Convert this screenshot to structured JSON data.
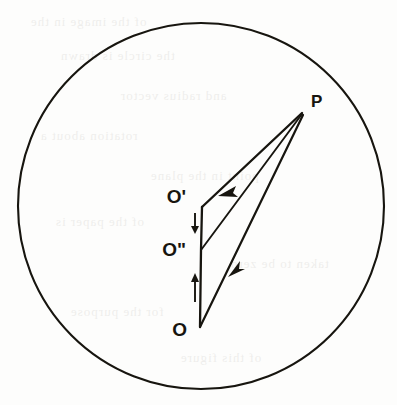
{
  "figure": {
    "type": "geometric-vector-diagram",
    "background_color": "#fdfdfc",
    "ink_color": "#17150f",
    "circle": {
      "label": "field-circle",
      "center_x": 201,
      "center_y": 206,
      "radius": 183,
      "stroke_width": 2.1
    },
    "points": [
      {
        "id": "P",
        "label": "P",
        "x": 302,
        "y": 113,
        "label_x": 311,
        "label_y": 107
      },
      {
        "id": "Op",
        "label": "O'",
        "x": 202,
        "y": 207,
        "label_x": 186,
        "label_y": 203
      },
      {
        "id": "Od",
        "label": "O\"",
        "x": 201,
        "y": 250,
        "label_x": 186,
        "label_y": 251
      },
      {
        "id": "O",
        "label": "O",
        "x": 200,
        "y": 327,
        "label_x": 187,
        "label_y": 335
      }
    ],
    "segments": [
      {
        "name": "P-to-Oprime",
        "from": "P",
        "to": "Op",
        "arrow": true,
        "arrow_at_x": 224,
        "arrow_at_y": 192
      },
      {
        "name": "P-to-Odouble",
        "from": "P",
        "to": "Od",
        "arrow": false
      },
      {
        "name": "P-to-O",
        "from": "P",
        "to": "O",
        "arrow": true,
        "arrow_at_x": 233,
        "arrow_at_y": 271
      },
      {
        "name": "O-to-Oprime-axis",
        "from": "O",
        "to": "Op",
        "arrow": false
      }
    ],
    "tick_arrows": [
      {
        "name": "down-arrow-to-Odouble",
        "direction": "down",
        "x": 195,
        "y_start": 214,
        "y_end": 232
      },
      {
        "name": "up-arrow-to-Odouble",
        "direction": "up",
        "x": 195,
        "y_start": 301,
        "y_end": 275
      }
    ],
    "ghost_text_lines": [
      "of the image in the",
      "the circle is drawn",
      "and radius vector",
      "rotation about a",
      "point in the plane",
      "of the paper is",
      "taken to be zero",
      "for the purpose",
      "of this figure"
    ]
  }
}
